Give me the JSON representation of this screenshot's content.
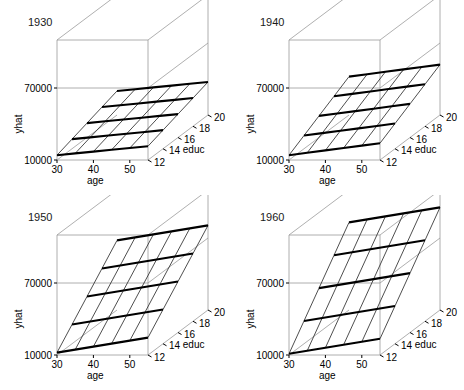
{
  "figure": {
    "layout": "2x2 grid of 3D wireframe surface plots",
    "panel_order": [
      "1930",
      "1940",
      "1950",
      "1960"
    ]
  },
  "chart_data": [
    {
      "type": "surface",
      "title": "1930",
      "xlabel": "age",
      "ylabel": "educ",
      "zlabel": "yhat",
      "x": [
        30,
        35,
        40,
        45,
        50,
        55
      ],
      "y": [
        12,
        14,
        16,
        18,
        20
      ],
      "xticks": [
        30,
        40,
        50
      ],
      "yticks": [
        12,
        14,
        16,
        18,
        20
      ],
      "zticks": [
        10000,
        70000
      ],
      "zlim": [
        10000,
        110000
      ],
      "xlim": [
        30,
        55
      ],
      "ylim": [
        12,
        20
      ],
      "grid": true,
      "legend": "none",
      "z": [
        [
          14000,
          18000,
          22000,
          26000,
          30000
        ],
        [
          15500,
          19500,
          23500,
          27500,
          31500
        ],
        [
          17000,
          21000,
          25000,
          29000,
          33000
        ],
        [
          18500,
          22500,
          26500,
          30500,
          34500
        ],
        [
          20000,
          24000,
          28000,
          32000,
          36000
        ],
        [
          21500,
          25500,
          29500,
          33500,
          37500
        ]
      ]
    },
    {
      "type": "surface",
      "title": "1940",
      "xlabel": "age",
      "ylabel": "educ",
      "zlabel": "yhat",
      "x": [
        30,
        35,
        40,
        45,
        50,
        55
      ],
      "y": [
        12,
        14,
        16,
        18,
        20
      ],
      "xticks": [
        30,
        40,
        50
      ],
      "yticks": [
        12,
        14,
        16,
        18,
        20
      ],
      "zticks": [
        10000,
        70000
      ],
      "zlim": [
        10000,
        110000
      ],
      "xlim": [
        30,
        55
      ],
      "ylim": [
        12,
        20
      ],
      "grid": true,
      "legend": "none",
      "z": [
        [
          14000,
          21000,
          28000,
          35000,
          42000
        ],
        [
          16000,
          23000,
          30000,
          37000,
          44000
        ],
        [
          18000,
          25000,
          32000,
          39000,
          46000
        ],
        [
          20000,
          27000,
          34000,
          41000,
          48000
        ],
        [
          22000,
          29000,
          36000,
          43000,
          50000
        ],
        [
          24000,
          31000,
          38000,
          45000,
          52000
        ]
      ]
    },
    {
      "type": "surface",
      "title": "1950",
      "xlabel": "age",
      "ylabel": "educ",
      "zlabel": "yhat",
      "x": [
        30,
        35,
        40,
        45,
        50,
        55
      ],
      "y": [
        12,
        14,
        16,
        18,
        20
      ],
      "xticks": [
        30,
        40,
        50
      ],
      "yticks": [
        12,
        14,
        16,
        18,
        20
      ],
      "zticks": [
        10000,
        70000
      ],
      "zlim": [
        10000,
        110000
      ],
      "xlim": [
        30,
        55
      ],
      "ylim": [
        12,
        20
      ],
      "grid": true,
      "legend": "none",
      "z": [
        [
          12000,
          26000,
          40000,
          54000,
          68000
        ],
        [
          14500,
          28500,
          42500,
          56500,
          70500
        ],
        [
          17000,
          31000,
          45000,
          59000,
          73000
        ],
        [
          19500,
          33500,
          47500,
          61500,
          75500
        ],
        [
          22000,
          36000,
          50000,
          64000,
          78000
        ],
        [
          24500,
          38500,
          52500,
          66500,
          80500
        ]
      ]
    },
    {
      "type": "surface",
      "title": "1960",
      "xlabel": "age",
      "ylabel": "educ",
      "zlabel": "yhat",
      "x": [
        30,
        35,
        40,
        45,
        50,
        55
      ],
      "y": [
        12,
        14,
        16,
        18,
        20
      ],
      "xticks": [
        30,
        40,
        50
      ],
      "yticks": [
        12,
        14,
        16,
        18,
        20
      ],
      "zticks": [
        10000,
        70000
      ],
      "zlim": [
        10000,
        110000
      ],
      "xlim": [
        30,
        55
      ],
      "ylim": [
        12,
        20
      ],
      "grid": true,
      "legend": "none",
      "z": [
        [
          11000,
          29000,
          47000,
          65000,
          83000
        ],
        [
          13500,
          31500,
          49500,
          67500,
          85500
        ],
        [
          16000,
          34000,
          52000,
          70000,
          88000
        ],
        [
          18500,
          36500,
          54500,
          72500,
          90500
        ],
        [
          21000,
          39000,
          57000,
          75000,
          93000
        ],
        [
          23500,
          41500,
          59500,
          77500,
          95500
        ]
      ]
    }
  ],
  "panels": [
    {
      "title": "1930",
      "zlabel": "yhat",
      "xlabel": "age",
      "ylabel": "educ",
      "ztick_hi": "70000",
      "ztick_lo": "10000",
      "xticks": [
        "30",
        "40",
        "50"
      ],
      "yticks": [
        "12",
        "14",
        "16",
        "18",
        "20"
      ]
    },
    {
      "title": "1940",
      "zlabel": "yhat",
      "xlabel": "age",
      "ylabel": "educ",
      "ztick_hi": "70000",
      "ztick_lo": "10000",
      "xticks": [
        "30",
        "40",
        "50"
      ],
      "yticks": [
        "12",
        "14",
        "16",
        "18",
        "20"
      ]
    },
    {
      "title": "1950",
      "zlabel": "yhat",
      "xlabel": "age",
      "ylabel": "educ",
      "ztick_hi": "70000",
      "ztick_lo": "10000",
      "xticks": [
        "30",
        "40",
        "50"
      ],
      "yticks": [
        "12",
        "14",
        "16",
        "18",
        "20"
      ]
    },
    {
      "title": "1960",
      "zlabel": "yhat",
      "xlabel": "age",
      "ylabel": "educ",
      "ztick_hi": "70000",
      "ztick_lo": "10000",
      "xticks": [
        "30",
        "40",
        "50"
      ],
      "yticks": [
        "12",
        "14",
        "16",
        "18",
        "20"
      ]
    }
  ],
  "colors": {
    "background": "#ffffff",
    "box_line": "#9a9a9a",
    "mesh_major": "#000000",
    "mesh_minor": "#3a3a3a",
    "text": "#000000"
  }
}
